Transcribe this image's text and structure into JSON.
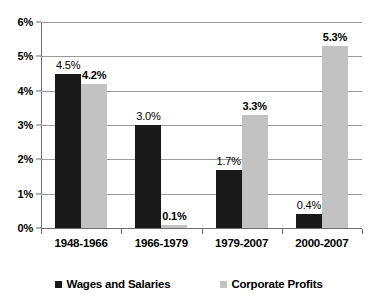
{
  "chart_data": {
    "type": "bar",
    "title": "",
    "subtitle": "",
    "xlabel": "",
    "ylabel": "",
    "categories": [
      "1948-1966",
      "1966-1979",
      "1979-2007",
      "2000-2007"
    ],
    "series": [
      {
        "name": "Wages and Salaries",
        "color": "#191919",
        "values": [
          4.5,
          3.0,
          1.7,
          0.4
        ],
        "labels": [
          "4.5%",
          "3.0%",
          "1.7%",
          "0.4%"
        ]
      },
      {
        "name": "Corporate Profits",
        "color": "#c2c2c2",
        "values": [
          4.2,
          0.1,
          3.3,
          5.3
        ],
        "labels": [
          "4.2%",
          "0.1%",
          "3.3%",
          "5.3%"
        ]
      }
    ],
    "ylim": [
      0,
      6
    ],
    "ytick_values": [
      0,
      1,
      2,
      3,
      4,
      5,
      6
    ],
    "ytick_labels": [
      "0%",
      "1%",
      "2%",
      "3%",
      "4%",
      "5%",
      "6%"
    ],
    "grid": true,
    "grid_axis": "y",
    "legend_position": "bottom",
    "background": "#ffffff",
    "axis_color": "#6e6e6e",
    "gridline_color": "#9a9a9a"
  },
  "legend": {
    "entries": [
      {
        "label": "Wages and Salaries",
        "swatch": "legend-swatch-dark"
      },
      {
        "label": "Corporate Profits",
        "swatch": "legend-swatch-gray"
      }
    ]
  }
}
